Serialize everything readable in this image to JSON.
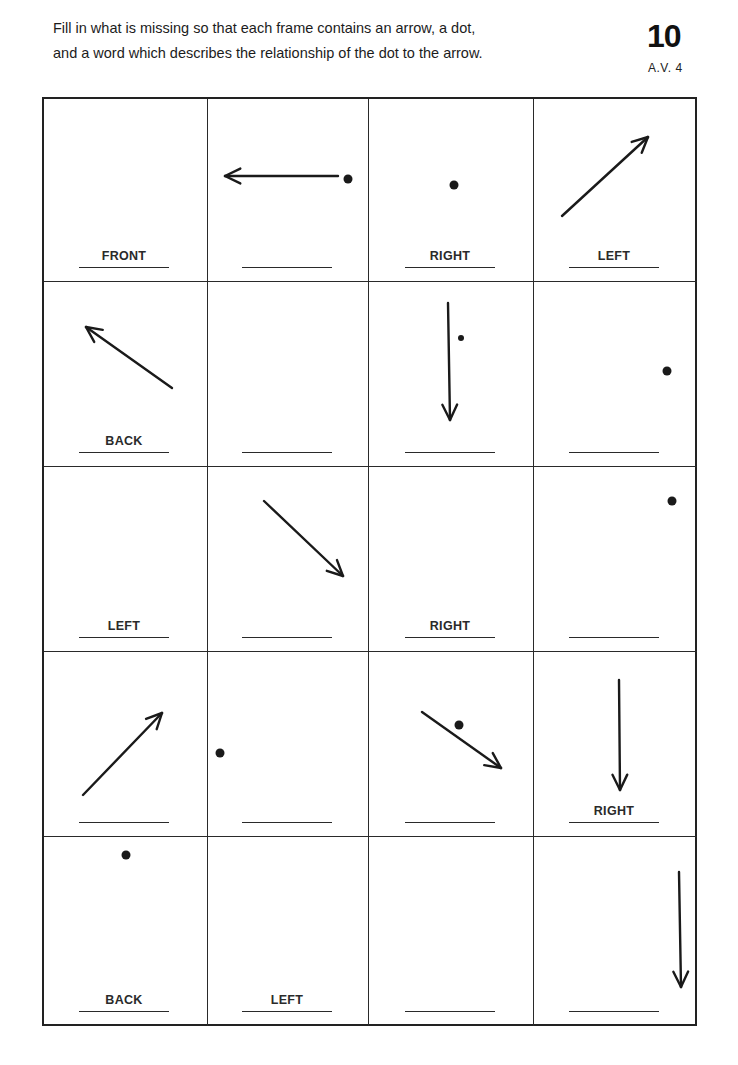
{
  "header": {
    "instruction_line_1": "Fill in what is missing so that each frame contains an arrow, a dot,",
    "instruction_line_2": "and a word which describes the relationship of the dot to the arrow.",
    "page_number": "10",
    "page_code": "A.V. 4"
  },
  "grid": {
    "rows": 5,
    "cols": 4,
    "cells": [
      {
        "row": 0,
        "col": 0,
        "word": "FRONT",
        "arrow": null,
        "dot": null
      },
      {
        "row": 0,
        "col": 1,
        "word": "",
        "arrow": {
          "x1": 130,
          "y1": 77,
          "x2": 17,
          "y2": 77
        },
        "dot": {
          "x": 140,
          "y": 80,
          "r": 4.5
        }
      },
      {
        "row": 0,
        "col": 2,
        "word": "RIGHT",
        "arrow": null,
        "dot": {
          "x": 85,
          "y": 86,
          "r": 4.5
        }
      },
      {
        "row": 0,
        "col": 3,
        "word": "LEFT",
        "arrow": {
          "x1": 28,
          "y1": 117,
          "x2": 114,
          "y2": 38
        },
        "dot": null
      },
      {
        "row": 1,
        "col": 0,
        "word": "BACK",
        "arrow": {
          "x1": 128,
          "y1": 106,
          "x2": 42,
          "y2": 45
        },
        "dot": null
      },
      {
        "row": 1,
        "col": 1,
        "word": "",
        "arrow": null,
        "dot": null
      },
      {
        "row": 1,
        "col": 2,
        "word": "",
        "arrow": {
          "x1": 79,
          "y1": 21,
          "x2": 81,
          "y2": 138
        },
        "dot": {
          "x": 92,
          "y": 56,
          "r": 3
        }
      },
      {
        "row": 1,
        "col": 3,
        "word": "",
        "arrow": null,
        "dot": {
          "x": 133,
          "y": 89,
          "r": 4.5
        }
      },
      {
        "row": 2,
        "col": 0,
        "word": "LEFT",
        "arrow": null,
        "dot": null
      },
      {
        "row": 2,
        "col": 1,
        "word": "",
        "arrow": {
          "x1": 56,
          "y1": 34,
          "x2": 135,
          "y2": 109
        },
        "dot": null
      },
      {
        "row": 2,
        "col": 2,
        "word": "RIGHT",
        "arrow": null,
        "dot": null
      },
      {
        "row": 2,
        "col": 3,
        "word": "",
        "arrow": null,
        "dot": {
          "x": 138,
          "y": 34,
          "r": 4.5
        }
      },
      {
        "row": 3,
        "col": 0,
        "word": "",
        "arrow": {
          "x1": 39,
          "y1": 143,
          "x2": 118,
          "y2": 61
        },
        "dot": null
      },
      {
        "row": 3,
        "col": 1,
        "word": "",
        "arrow": null,
        "dot": {
          "x": 12,
          "y": 101,
          "r": 4.5
        }
      },
      {
        "row": 3,
        "col": 2,
        "word": "",
        "arrow": {
          "x1": 53,
          "y1": 60,
          "x2": 132,
          "y2": 116
        },
        "dot": {
          "x": 90,
          "y": 73,
          "r": 4.5
        }
      },
      {
        "row": 3,
        "col": 3,
        "word": "RIGHT",
        "arrow": {
          "x1": 85,
          "y1": 28,
          "x2": 86,
          "y2": 138
        },
        "dot": null
      },
      {
        "row": 4,
        "col": 0,
        "word": "BACK",
        "arrow": null,
        "dot": {
          "x": 82,
          "y": 18,
          "r": 4.5
        }
      },
      {
        "row": 4,
        "col": 1,
        "word": "LEFT",
        "arrow": null,
        "dot": null
      },
      {
        "row": 4,
        "col": 2,
        "word": "",
        "arrow": null,
        "dot": null
      },
      {
        "row": 4,
        "col": 3,
        "word": "",
        "arrow": {
          "x1": 145,
          "y1": 35,
          "x2": 147,
          "y2": 150
        },
        "dot": null
      }
    ]
  }
}
